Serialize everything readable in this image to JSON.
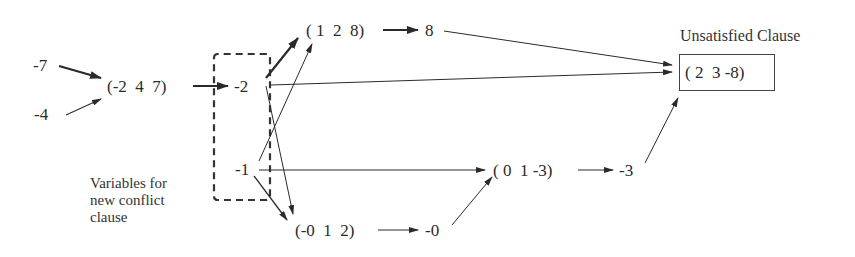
{
  "diagram": {
    "type": "implication-graph",
    "nodes": {
      "n7": "-7",
      "n4": "-4",
      "c247": "(-2  4  7)",
      "n2": "-2",
      "n1": "-1",
      "c128": "( 1  2  8)",
      "p8": "8",
      "c012": "(-0  1  2)",
      "n0": "-0",
      "c013": "( 0  1 -3)",
      "n3": "-3",
      "c238": "( 2  3 -8)"
    },
    "labels": {
      "unsatisfied_clause": "Unsatisfied Clause",
      "conflict_vars_line1": "Variables for",
      "conflict_vars_line2": "new conflict",
      "conflict_vars_line3": "clause"
    },
    "edges": [
      {
        "from": "-7",
        "to": "(-2 4 7)",
        "bold": true
      },
      {
        "from": "-4",
        "to": "(-2 4 7)",
        "bold": false
      },
      {
        "from": "(-2 4 7)",
        "to": "-2",
        "bold": true
      },
      {
        "from": "-2",
        "to": "(1 2 8)",
        "bold": true
      },
      {
        "from": "-2",
        "to": "(2 3 -8)",
        "bold": false
      },
      {
        "from": "-2",
        "to": "(-0 1 2)",
        "bold": false
      },
      {
        "from": "-1",
        "to": "(1 2 8)",
        "bold": false
      },
      {
        "from": "-1",
        "to": "(0 1 -3)",
        "bold": false
      },
      {
        "from": "-1",
        "to": "(-0 1 2)",
        "bold": false
      },
      {
        "from": "(1 2 8)",
        "to": "8",
        "bold": true
      },
      {
        "from": "8",
        "to": "(2 3 -8)",
        "bold": false
      },
      {
        "from": "(-0 1 2)",
        "to": "-0",
        "bold": false
      },
      {
        "from": "-0",
        "to": "(0 1 -3)",
        "bold": false
      },
      {
        "from": "(0 1 -3)",
        "to": "-3",
        "bold": false
      },
      {
        "from": "-3",
        "to": "(2 3 -8)",
        "bold": false
      }
    ],
    "colors": {
      "ink": "#2a2a2a",
      "background": "#ffffff"
    }
  }
}
